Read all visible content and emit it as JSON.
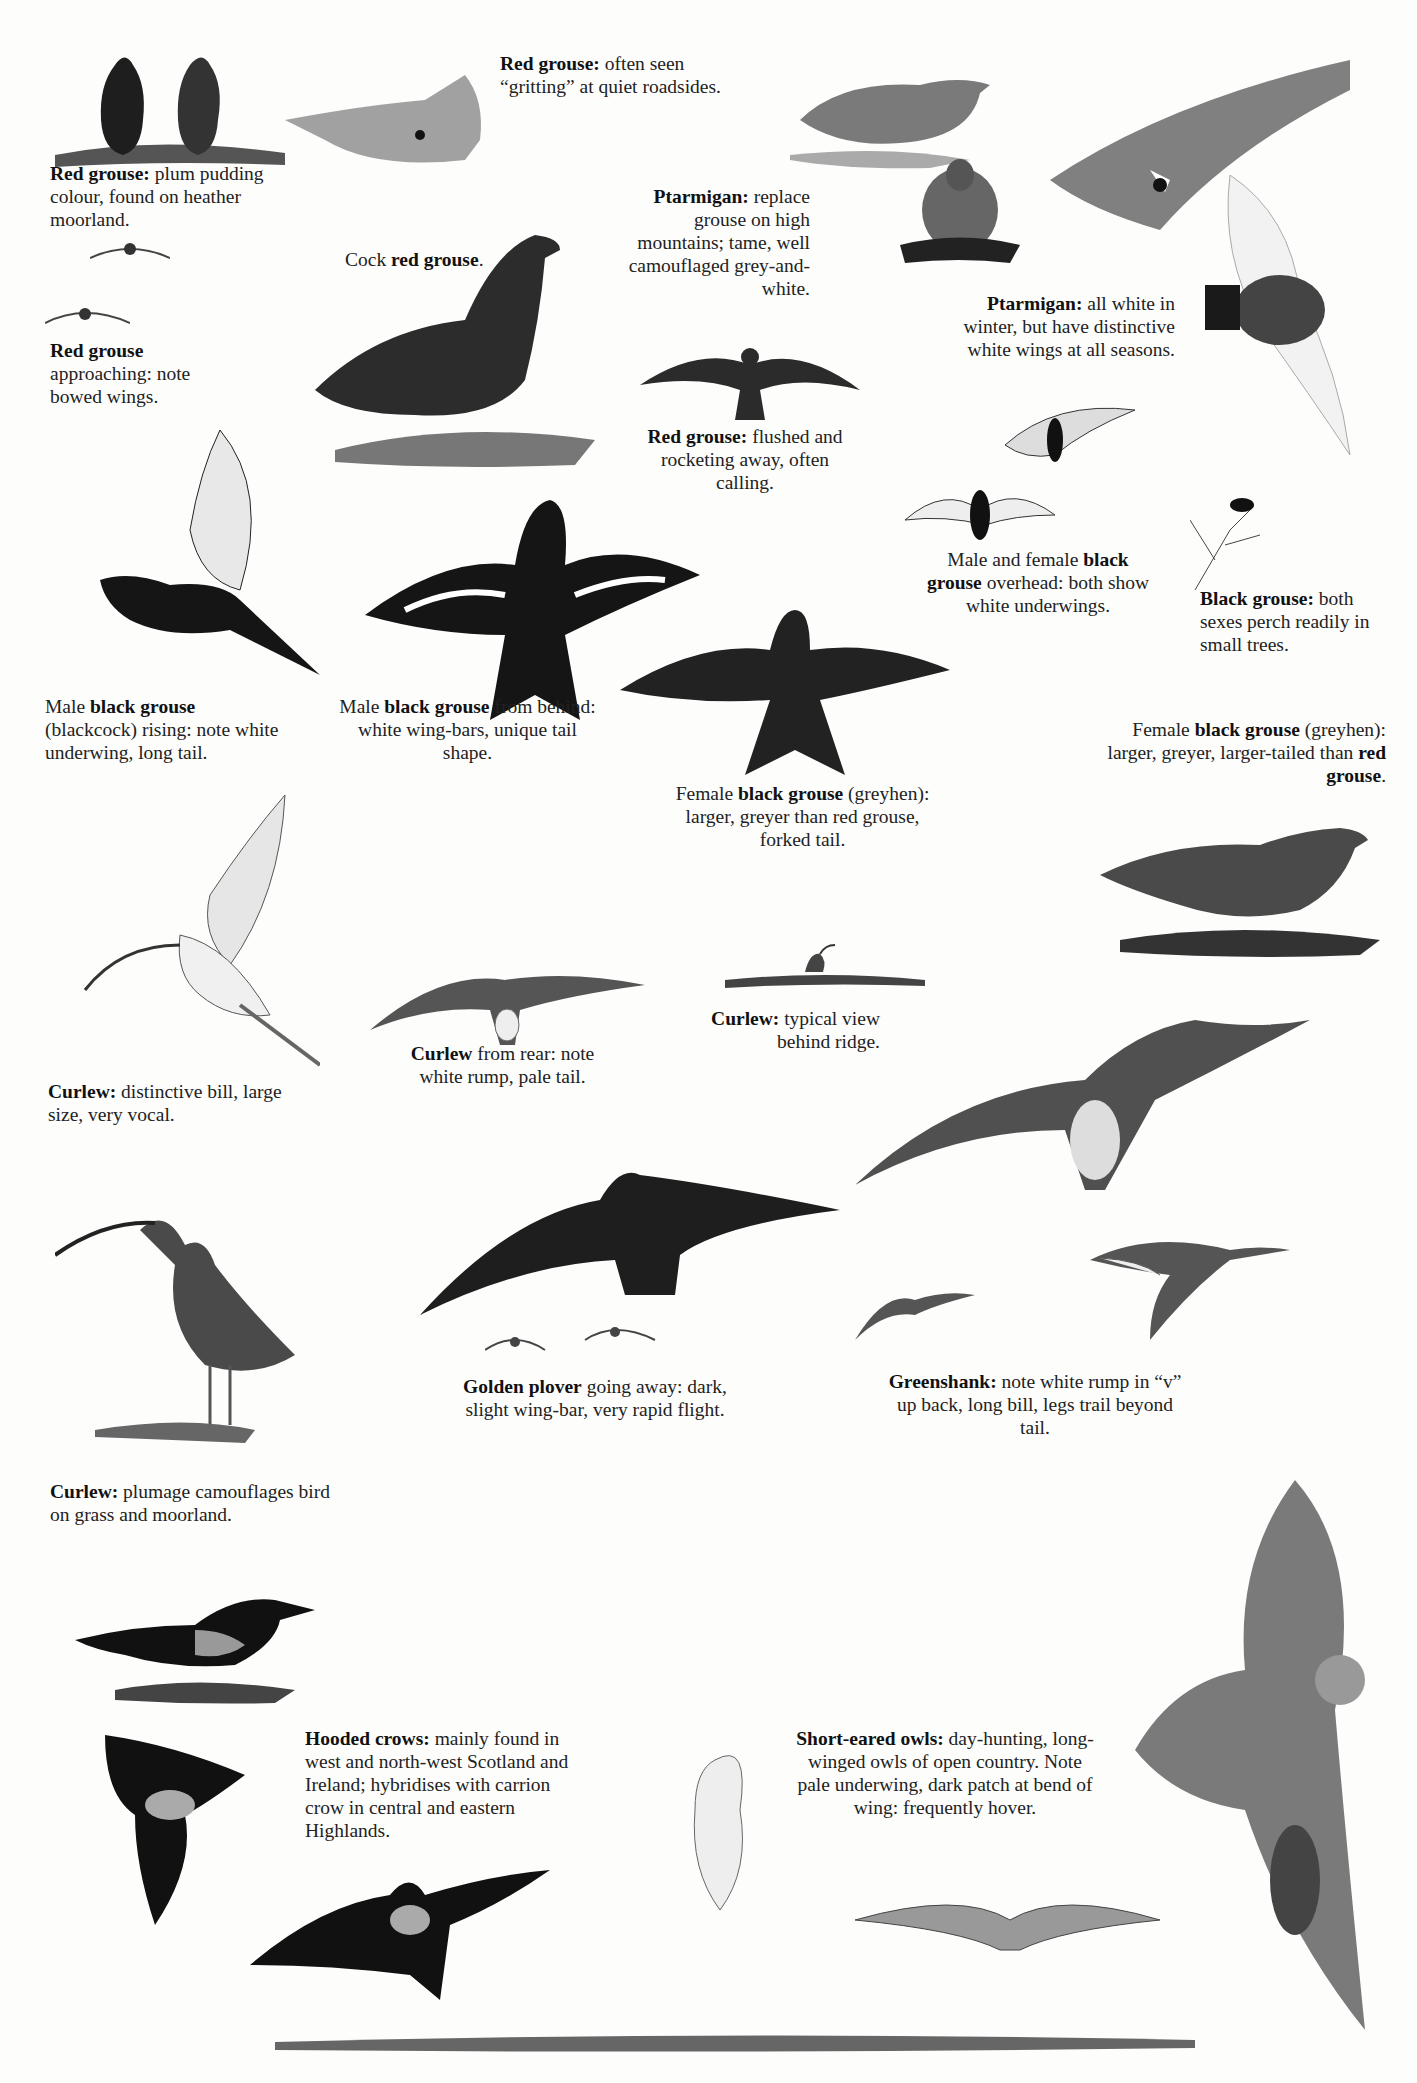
{
  "page": {
    "background": "#fdfdfc",
    "ink_color": "#1c1c1c"
  },
  "captions": {
    "red_grouse_plum": {
      "bold": "Red grouse:",
      "text": " plum pudding colour, found on heather moorland."
    },
    "red_grouse_gritting": {
      "bold": "Red grouse:",
      "text": " often seen “gritting” at quiet roadsides."
    },
    "red_grouse_approaching": {
      "bold": "Red grouse",
      "text": " approaching: note bowed wings."
    },
    "cock_red_grouse": {
      "pre": "Cock ",
      "bold": "red grouse",
      "text": "."
    },
    "ptarmigan_mountains": {
      "bold": "Ptarmigan:",
      "text": " replace grouse on high mountains; tame, well camouflaged grey-and-white."
    },
    "ptarmigan_winter": {
      "bold": "Ptarmigan:",
      "text": " all white in winter, but have distinctive white wings at all seasons."
    },
    "red_grouse_flushed": {
      "bold": "Red grouse:",
      "text": " flushed and rocketing away, often calling."
    },
    "black_grouse_overhead": {
      "pre": "Male and female ",
      "bold": "black grouse",
      "text": " overhead: both show white underwings."
    },
    "black_grouse_perch": {
      "bold": "Black grouse:",
      "text": " both sexes perch readily in small trees."
    },
    "male_black_grouse_rising": {
      "pre": "Male ",
      "bold": "black grouse",
      "text": " (blackcock) rising: note white underwing, long tail."
    },
    "male_black_grouse_behind": {
      "pre": "Male ",
      "bold": "black grouse",
      "text": " from behind: white wing-bars, unique tail shape."
    },
    "female_black_grouse_forked": {
      "pre": "Female ",
      "bold": "black grouse",
      "text": " (greyhen): larger, greyer than red grouse, forked tail."
    },
    "female_black_grouse_larger": {
      "pre": "Female ",
      "bold": "black grouse",
      "text": " (greyhen): larger, greyer, larger-tailed than ",
      "bold2": "red grouse",
      "text2": "."
    },
    "curlew_bill": {
      "bold": "Curlew:",
      "text": " distinctive bill, large size, very vocal."
    },
    "curlew_rear": {
      "bold": "Curlew",
      "text": " from rear: note white rump, pale tail."
    },
    "curlew_ridge": {
      "bold": "Curlew:",
      "text": " typical view behind ridge."
    },
    "curlew_plumage": {
      "bold": "Curlew:",
      "text": " plumage camouflages bird on grass and moorland."
    },
    "golden_plover": {
      "bold": "Golden plover",
      "text": " going away: dark, slight wing-bar, very rapid flight."
    },
    "greenshank": {
      "bold": "Greenshank:",
      "text": " note white rump in “v” up back, long bill, legs trail beyond tail."
    },
    "hooded_crows": {
      "bold": "Hooded crows:",
      "text": " mainly found in west and north-west Scotland and Ireland; hybridises with carrion crow in central and eastern Highlands."
    },
    "short_eared_owls": {
      "bold": "Short-eared owls:",
      "text": " day-hunting, long-winged owls of open country. Note pale underwing, dark patch at bend of wing: frequently hover."
    }
  },
  "illustrations": [
    "red-grouse-pair",
    "red-grouse-roadside",
    "ptarmigan-standing",
    "ptarmigan-sitting",
    "ptarmigan-flight-mountain",
    "red-grouse-flying-small",
    "red-grouse-approaching",
    "cock-red-grouse",
    "red-grouse-flushed",
    "ptarmigan-winter-flight",
    "black-grouse-overhead-pair",
    "black-grouse-in-tree",
    "male-black-grouse-rising",
    "male-black-grouse-behind",
    "female-black-grouse-flight",
    "female-black-grouse-standing",
    "curlew-flight-side",
    "curlew-rear-flight",
    "curlew-behind-ridge",
    "curlew-large-flight",
    "curlew-standing",
    "golden-plover-flight",
    "golden-plover-small",
    "greenshank-flight",
    "greenshank-small",
    "hooded-crow-standing",
    "hooded-crow-flight-1",
    "hooded-crow-flight-2",
    "short-eared-owl-flights",
    "short-eared-owl-large",
    "ground-strip"
  ]
}
